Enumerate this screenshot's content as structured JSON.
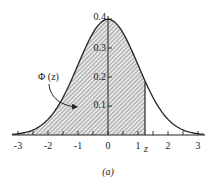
{
  "chart_data": {
    "type": "area",
    "title": "",
    "caption": "(a)",
    "xlabel": "",
    "ylabel": "",
    "xlim": [
      -3,
      3
    ],
    "ylim": [
      0,
      0.4
    ],
    "x_ticks": [
      "-3",
      "-2",
      "-1",
      "0",
      "1",
      "2",
      "3"
    ],
    "y_ticks": [
      "0.1",
      "0.2",
      "0.3",
      "0.4"
    ],
    "series": [
      {
        "name": "standard normal pdf",
        "function": "phi(x) = exp(-x^2/2)/sqrt(2*pi)",
        "x": [
          -3,
          -2.5,
          -2,
          -1.5,
          -1,
          -0.5,
          0,
          0.5,
          1,
          1.5,
          2,
          2.5,
          3
        ],
        "values": [
          0.004,
          0.018,
          0.054,
          0.13,
          0.242,
          0.352,
          0.399,
          0.352,
          0.242,
          0.13,
          0.054,
          0.018,
          0.004
        ]
      }
    ],
    "shaded_region": {
      "from": "-inf",
      "to": 1.23,
      "label": "Φ (z)"
    },
    "annotations": [
      {
        "text": "Φ (z)",
        "type": "label-with-arrow"
      },
      {
        "text": "z",
        "position": "x-axis at shaded boundary"
      }
    ],
    "grid": false,
    "legend": "none"
  },
  "labels": {
    "phi": "Φ (z)",
    "z": "z",
    "caption": "(a)",
    "x": [
      "-3",
      "-2",
      "-1",
      "0",
      "1",
      "2",
      "3"
    ],
    "y": [
      "0.1",
      "0.2",
      "0.3",
      "0.4"
    ]
  }
}
